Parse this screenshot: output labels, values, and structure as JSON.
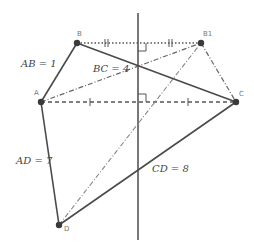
{
  "diagram": {
    "colors": {
      "line": "#4a4a4a",
      "point": "#3a3a3a",
      "label": "#777777",
      "text": "#444444"
    },
    "points": {
      "A": {
        "label": "A",
        "x": 41,
        "y": 102
      },
      "B": {
        "label": "B",
        "x": 77,
        "y": 43
      },
      "B1": {
        "label": "B1",
        "x": 201,
        "y": 43
      },
      "C": {
        "label": "C",
        "x": 236,
        "y": 102
      },
      "D": {
        "label": "D",
        "x": 59,
        "y": 225
      }
    },
    "lengths": {
      "AB": "AB = 1",
      "BC": "BC = 4",
      "AD": "AD = 7",
      "CD": "CD = 8"
    },
    "perpendicular_bisector": {
      "x": 138,
      "y1": 13,
      "y2": 240
    }
  }
}
